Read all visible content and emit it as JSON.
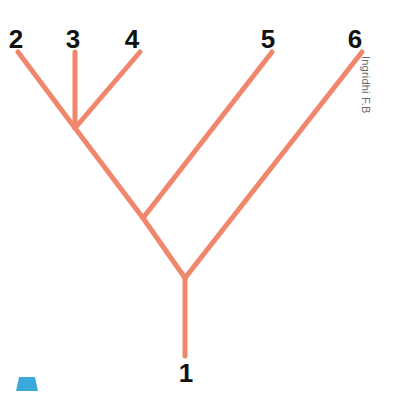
{
  "figure": {
    "type": "cladogram",
    "title": "",
    "background_color": "#ffffff",
    "branch_color": "#f0876d",
    "branch_width": 5,
    "label_color": "#111111"
  },
  "labels": {
    "taxon_1": "1",
    "taxon_2": "2",
    "taxon_3": "3",
    "taxon_4": "4",
    "taxon_5": "5",
    "taxon_6": "6"
  },
  "watermark": {
    "text": "Ingridhi F.B",
    "color": "#6d6d6d"
  },
  "corner_mark": {
    "name": "blue-trapezoid-mark",
    "color": "#3aa8d8"
  },
  "chart_data": {
    "type": "diagram",
    "title": "",
    "xlabel": "",
    "ylabel": "",
    "tips": [
      {
        "label": "2",
        "x": 18,
        "y": 52
      },
      {
        "label": "3",
        "x": 75,
        "y": 52
      },
      {
        "label": "4",
        "x": 140,
        "y": 52
      },
      {
        "label": "5",
        "x": 272,
        "y": 52
      },
      {
        "label": "6",
        "x": 362,
        "y": 52
      },
      {
        "label": "1",
        "x": 185,
        "y": 356
      }
    ],
    "nodes": [
      {
        "name": "node-234",
        "x": 75,
        "y": 128
      },
      {
        "name": "node-2345",
        "x": 143,
        "y": 218
      },
      {
        "name": "root-node",
        "x": 185,
        "y": 278
      }
    ],
    "edges": [
      {
        "from": "tip-2",
        "to": "node-234"
      },
      {
        "from": "tip-3",
        "to": "node-234"
      },
      {
        "from": "tip-4",
        "to": "node-234"
      },
      {
        "from": "node-234",
        "to": "node-2345"
      },
      {
        "from": "tip-5",
        "to": "node-2345"
      },
      {
        "from": "node-2345",
        "to": "root-node"
      },
      {
        "from": "tip-6",
        "to": "root-node"
      },
      {
        "from": "root-node",
        "to": "tip-1"
      }
    ]
  }
}
